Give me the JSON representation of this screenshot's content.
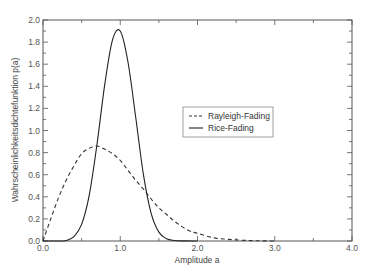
{
  "chart_data": {
    "type": "line",
    "title": "",
    "xlabel": "Amplitude a",
    "ylabel": "Wahrscheinlichkeitsdichtefunktion  p(a)",
    "xlim": [
      0.0,
      4.0
    ],
    "ylim": [
      0.0,
      2.0
    ],
    "xticks": [
      "0.0",
      "1.0",
      "2.0",
      "3.0",
      "4.0"
    ],
    "yticks": [
      "0.0",
      "0.2",
      "0.4",
      "0.6",
      "0.8",
      "1.0",
      "1.2",
      "1.4",
      "1.6",
      "1.8",
      "2.0"
    ],
    "grid": false,
    "legend_position": "center-right",
    "series": [
      {
        "name": "Rayleigh-Fading",
        "style": "dashed",
        "color": "#333333",
        "x": [
          0.0,
          0.1,
          0.2,
          0.3,
          0.4,
          0.5,
          0.6,
          0.7,
          0.8,
          0.9,
          1.0,
          1.1,
          1.2,
          1.3,
          1.4,
          1.5,
          1.6,
          1.7,
          1.8,
          1.9,
          2.0,
          2.2,
          2.4,
          2.6,
          2.8,
          3.0
        ],
        "y": [
          0.0,
          0.2,
          0.39,
          0.55,
          0.68,
          0.79,
          0.84,
          0.86,
          0.83,
          0.79,
          0.73,
          0.64,
          0.55,
          0.47,
          0.38,
          0.3,
          0.24,
          0.18,
          0.13,
          0.09,
          0.07,
          0.03,
          0.015,
          0.006,
          0.002,
          0.0
        ]
      },
      {
        "name": "Rice-Fading",
        "style": "solid",
        "color": "#222222",
        "x": [
          0.0,
          0.2,
          0.3,
          0.4,
          0.5,
          0.6,
          0.7,
          0.8,
          0.9,
          1.0,
          1.1,
          1.2,
          1.3,
          1.4,
          1.5,
          1.6,
          1.7,
          1.8,
          2.0
        ],
        "y": [
          0.0,
          0.0,
          0.005,
          0.04,
          0.15,
          0.42,
          0.88,
          1.42,
          1.82,
          1.9,
          1.62,
          1.12,
          0.6,
          0.25,
          0.08,
          0.02,
          0.005,
          0.001,
          0.0
        ]
      }
    ]
  },
  "legend": {
    "items": [
      {
        "label": "Rayleigh-Fading",
        "style": "dashed"
      },
      {
        "label": "Rice-Fading",
        "style": "solid"
      }
    ]
  }
}
